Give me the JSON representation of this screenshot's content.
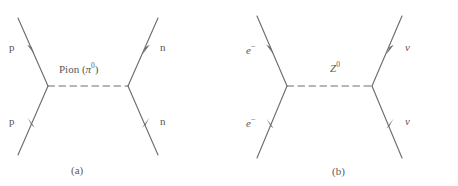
{
  "figure": {
    "background_color": "#ffffff",
    "line_color": "#6e6e6e",
    "text_color": "#565656",
    "panels": [
      {
        "id": "a",
        "caption": "(a)",
        "propagator": {
          "name": "Pion",
          "label_prefix": "Pion (",
          "symbol": "π",
          "charge": "0",
          "label_suffix": ")",
          "style": "dashed"
        },
        "incoming": [
          {
            "label": "p",
            "position": "upper-left",
            "italic": false
          },
          {
            "label": "p",
            "position": "lower-left",
            "italic": false
          }
        ],
        "outgoing": [
          {
            "label": "n",
            "position": "upper-right",
            "italic": false
          },
          {
            "label": "n",
            "position": "lower-right",
            "italic": false
          }
        ]
      },
      {
        "id": "b",
        "caption": "(b)",
        "propagator": {
          "name": "Z boson",
          "label_prefix": "",
          "symbol": "Z",
          "charge": "0",
          "label_suffix": "",
          "style": "dashed"
        },
        "incoming": [
          {
            "label": "e",
            "charge": "−",
            "position": "upper-left",
            "italic": true
          },
          {
            "label": "e",
            "charge": "−",
            "position": "lower-left",
            "italic": true
          }
        ],
        "outgoing": [
          {
            "label": "ν",
            "position": "upper-right",
            "italic": true
          },
          {
            "label": "ν",
            "position": "lower-right",
            "italic": true
          }
        ]
      }
    ]
  },
  "panel_a": {
    "label_p_top": "p",
    "label_p_bottom": "p",
    "label_n_top": "n",
    "label_n_bottom": "n",
    "propagator_prefix": "Pion (",
    "propagator_symbol": "π",
    "propagator_charge": "0",
    "propagator_suffix": ")",
    "caption": "(a)"
  },
  "panel_b": {
    "label_e_top": "e",
    "label_e_top_charge": "−",
    "label_e_bottom": "e",
    "label_e_bottom_charge": "−",
    "label_nu_top": "ν",
    "label_nu_bottom": "ν",
    "propagator_symbol": "Z",
    "propagator_charge": "0",
    "caption": "(b)"
  }
}
